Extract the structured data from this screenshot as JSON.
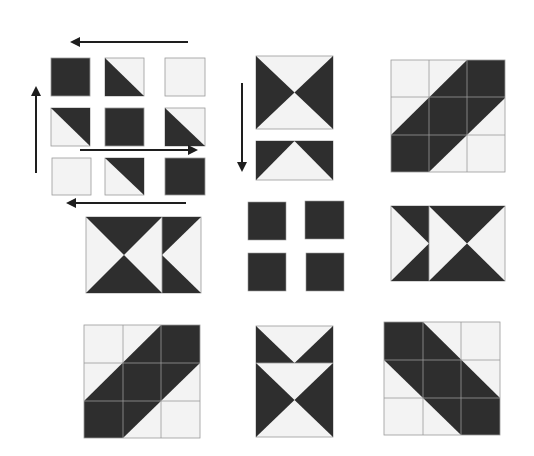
{
  "diagram": {
    "title": "Quilt block piecing diagram",
    "colors": {
      "dark": "#2e2e2e",
      "light": "#f3f3f3",
      "seam": "#9a9a9a",
      "arrow": "#1e1e1e"
    },
    "panels": [
      {
        "id": "row1-col1",
        "label": "nine-patch-with-pressing-arrows"
      },
      {
        "id": "row1-col2",
        "label": "hourglass-with-half-strip"
      },
      {
        "id": "row1-col3",
        "label": "diagonal-stripe-block-ascending"
      },
      {
        "id": "row2-col1",
        "label": "hourglass-plus-right-half"
      },
      {
        "id": "row2-col2",
        "label": "four-dark-squares"
      },
      {
        "id": "row2-col3",
        "label": "left-half-plus-hourglass"
      },
      {
        "id": "row3-col1",
        "label": "diagonal-stripe-block-ascending"
      },
      {
        "id": "row3-col2",
        "label": "half-strip-plus-hourglass"
      },
      {
        "id": "row3-col3",
        "label": "diagonal-stripe-block-descending"
      }
    ],
    "arrows": [
      {
        "name": "top-arrow",
        "direction": "left"
      },
      {
        "name": "left-arrow",
        "direction": "up"
      },
      {
        "name": "middle-arrow",
        "direction": "right"
      },
      {
        "name": "bottom-arrow",
        "direction": "left"
      },
      {
        "name": "vertical-arrow",
        "direction": "down"
      }
    ]
  }
}
